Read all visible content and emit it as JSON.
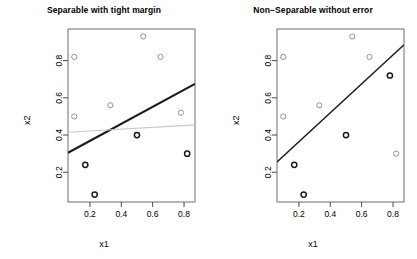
{
  "figure": {
    "background": "#ffffff",
    "width": 417,
    "height": 259
  },
  "chart_data": [
    {
      "id": "left",
      "type": "scatter",
      "title": "Separable with tight margin",
      "xlabel": "x1",
      "ylabel": "x2",
      "xlim": [
        0.06,
        0.87
      ],
      "ylim": [
        0.04,
        0.97
      ],
      "xticks": [
        0.2,
        0.4,
        0.6,
        0.8
      ],
      "xticklabels": [
        "0.2",
        "0.4",
        "0.6",
        "0.8"
      ],
      "yticks": [
        0.2,
        0.4,
        0.6,
        0.8
      ],
      "yticklabels": [
        "0.2",
        "0.4",
        "0.6",
        "0.8"
      ],
      "grid": false,
      "legend": "none",
      "series": [
        {
          "name": "class-light",
          "marker": "open-circle",
          "color": "#888888",
          "points": [
            {
              "x": 0.1,
              "y": 0.82
            },
            {
              "x": 0.1,
              "y": 0.5
            },
            {
              "x": 0.33,
              "y": 0.56
            },
            {
              "x": 0.54,
              "y": 0.93
            },
            {
              "x": 0.65,
              "y": 0.82
            },
            {
              "x": 0.78,
              "y": 0.52
            }
          ]
        },
        {
          "name": "class-dark",
          "marker": "open-circle",
          "color": "#1a1a1a",
          "points": [
            {
              "x": 0.17,
              "y": 0.24
            },
            {
              "x": 0.23,
              "y": 0.08
            },
            {
              "x": 0.5,
              "y": 0.4
            },
            {
              "x": 0.82,
              "y": 0.3
            }
          ]
        }
      ],
      "lines": [
        {
          "name": "separating-boundary",
          "color": "#1a1a1a",
          "width": 2.1,
          "from": {
            "x": 0.06,
            "y": 0.305
          },
          "to": {
            "x": 0.87,
            "y": 0.675
          }
        },
        {
          "name": "reference-boundary",
          "color": "#c8c8c8",
          "width": 1.2,
          "from": {
            "x": 0.06,
            "y": 0.415
          },
          "to": {
            "x": 0.87,
            "y": 0.455
          }
        }
      ]
    },
    {
      "id": "right",
      "type": "scatter",
      "title": "Non−Separable without error",
      "xlabel": "x1",
      "ylabel": "x2",
      "xlim": [
        0.06,
        0.87
      ],
      "ylim": [
        0.04,
        0.97
      ],
      "xticks": [
        0.2,
        0.4,
        0.6,
        0.8
      ],
      "xticklabels": [
        "0.2",
        "0.4",
        "0.6",
        "0.8"
      ],
      "yticks": [
        0.2,
        0.4,
        0.6,
        0.8
      ],
      "yticklabels": [
        "0.2",
        "0.4",
        "0.6",
        "0.8"
      ],
      "grid": false,
      "legend": "none",
      "series": [
        {
          "name": "class-light",
          "marker": "open-circle",
          "color": "#888888",
          "points": [
            {
              "x": 0.1,
              "y": 0.82
            },
            {
              "x": 0.1,
              "y": 0.5
            },
            {
              "x": 0.33,
              "y": 0.56
            },
            {
              "x": 0.54,
              "y": 0.93
            },
            {
              "x": 0.65,
              "y": 0.82
            },
            {
              "x": 0.82,
              "y": 0.3
            }
          ]
        },
        {
          "name": "class-dark",
          "marker": "open-circle",
          "color": "#1a1a1a",
          "points": [
            {
              "x": 0.17,
              "y": 0.24
            },
            {
              "x": 0.23,
              "y": 0.08
            },
            {
              "x": 0.5,
              "y": 0.4
            },
            {
              "x": 0.78,
              "y": 0.72
            }
          ]
        }
      ],
      "lines": [
        {
          "name": "separating-boundary",
          "color": "#1a1a1a",
          "width": 1.4,
          "from": {
            "x": 0.06,
            "y": 0.255
          },
          "to": {
            "x": 0.87,
            "y": 0.885
          }
        }
      ]
    }
  ]
}
